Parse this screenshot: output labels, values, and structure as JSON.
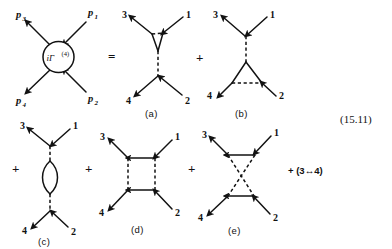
{
  "figure": {
    "equation_number": "(15.11)",
    "vertex_blob": {
      "label_base": "iΓ",
      "label_superscript": "(4)",
      "momentum_labels": [
        {
          "name": "p3",
          "base": "p",
          "sub": "3",
          "position": "upper-left"
        },
        {
          "name": "p1",
          "base": "p",
          "sub": "1",
          "position": "upper-right"
        },
        {
          "name": "p4",
          "base": "p",
          "sub": "4",
          "position": "lower-left"
        },
        {
          "name": "p2",
          "base": "p",
          "sub": "2",
          "position": "lower-right"
        }
      ]
    },
    "operators": {
      "equals": "=",
      "plus": "+"
    },
    "swap_term": "+ (3↔4)",
    "diagrams": [
      {
        "id": "a",
        "caption": "(a)",
        "type": "triangle-top-s-channel",
        "leg_labels": {
          "upper_left": "3",
          "upper_right": "1",
          "lower_left": "4",
          "lower_right": "2"
        }
      },
      {
        "id": "b",
        "caption": "(b)",
        "type": "triangle-bottom-s-channel",
        "leg_labels": {
          "upper_left": "3",
          "upper_right": "1",
          "lower_left": "4",
          "lower_right": "2"
        }
      },
      {
        "id": "c",
        "caption": "(c)",
        "type": "bubble-s-channel",
        "leg_labels": {
          "upper_left": "3",
          "upper_right": "1",
          "lower_left": "4",
          "lower_right": "2"
        }
      },
      {
        "id": "d",
        "caption": "(d)",
        "type": "box",
        "leg_labels": {
          "upper_left": "3",
          "upper_right": "1",
          "lower_left": "4",
          "lower_right": "2"
        }
      },
      {
        "id": "e",
        "caption": "(e)",
        "type": "crossed-box",
        "leg_labels": {
          "upper_left": "3",
          "upper_right": "1",
          "lower_left": "4",
          "lower_right": "2"
        }
      }
    ],
    "colors": {
      "ink": "#121212",
      "background": "#ffffff"
    }
  }
}
